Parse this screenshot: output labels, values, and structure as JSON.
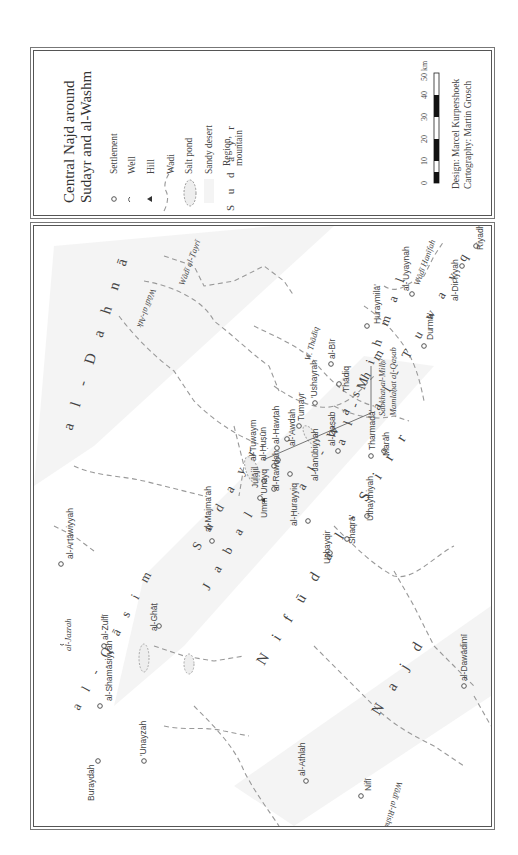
{
  "legend": {
    "title_line1": "Central Najd around",
    "title_line2": "Sudayr and al-Washm",
    "items": [
      {
        "symbol": "settlement-circle",
        "label": "Settlement"
      },
      {
        "symbol": "well-arc",
        "label": "Well"
      },
      {
        "symbol": "hill-triangle",
        "label": "Hill"
      },
      {
        "symbol": "wadi-dashed-line",
        "label": "Wadi"
      },
      {
        "symbol": "salt-pond-oval",
        "label": "Salt pond"
      },
      {
        "symbol": "sandy-desert-stipple",
        "label": "Sandy desert"
      },
      {
        "symbol": "region-lettering",
        "sample": "S u d a y r",
        "label_line1": "Region,",
        "label_line2": "mountain"
      }
    ],
    "scale_bar": {
      "ticks": [
        "0",
        "10",
        "20",
        "30",
        "40",
        "50 km"
      ]
    },
    "credits": {
      "design": "Design: Marcel Kurpershoek",
      "cartography": "Cartography: Martin Grosch"
    }
  },
  "map": {
    "regions": [
      {
        "name": "al-Dahnā",
        "text": "a l - D a h n ā"
      },
      {
        "name": "Sudayr",
        "text": "S u d a y r"
      },
      {
        "name": "Jabal",
        "text": "J a b a l"
      },
      {
        "name": "al-Washm",
        "text": "a l - W a s h m"
      },
      {
        "name": "al-Mihmal",
        "text": "a l - M i h m a l"
      },
      {
        "name": "al-Tuwayq",
        "text": "a l - T u w a y q"
      },
      {
        "name": "Nifud al-Sirr",
        "text": "N i f ū d   a l - S i r r"
      },
      {
        "name": "Najd",
        "text": "N a j d"
      },
      {
        "name": "al-Qasim",
        "text": "a l - Q ā s i m"
      }
    ],
    "wadis": [
      "Wādī al-Ṭayrī",
      "Wādī al-Atk",
      "W. Thādiq",
      "Wādī Ḥanīfah",
      "Wādī al-Rishā"
    ],
    "salt_pond_label": {
      "line1": "Sabkhat al-Milḥ/",
      "line2": "Mamlaḥat al-Qaṣab"
    },
    "settlements": [
      "Riyadh",
      "al-Dir'iyyah",
      "al-'Uyaynah",
      "Durmā'",
      "Huraymilā'",
      "al-Bīr",
      "Thādiq",
      "Tumayr",
      "'Ushayrah",
      "al-'Awdah",
      "al-Hawṭah",
      "al-Ḥuṣūn",
      "al-Tuwaym",
      "Julājil",
      "Umm 'Unayq",
      "al-Rawḍah",
      "al-Janūbiyyah",
      "al-Qaṣab",
      "Tharmadā'",
      "Marāh",
      "al-Ḥurayyiq",
      "Ushayqir",
      "Shaqrā'",
      "Uthaythiyah",
      "al-Majma'ah",
      "al-Arṭāwiyyah",
      "al-Ghāṭ",
      "al-Zulfī",
      "al-Jazrah",
      "al-Shamāsiyyah",
      "Buraydah",
      "'Unayzah",
      "al-Athlah",
      "Nifī",
      "al-Dawādimī"
    ]
  }
}
